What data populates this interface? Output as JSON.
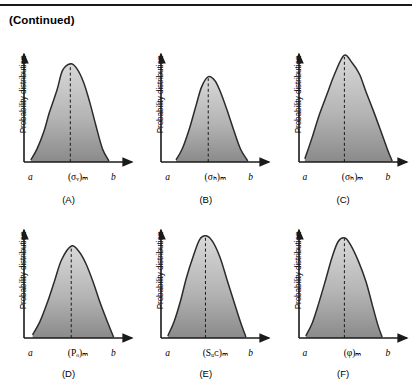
{
  "header": {
    "continued_label": "(Continued)"
  },
  "common": {
    "y_axis_label": "Probability distribution",
    "x_start_label": "a",
    "x_end_label": "b",
    "fill_top_color": "#d9d9d9",
    "fill_bottom_color": "#8a8a8a",
    "curve_color": "#2b2b2b",
    "axis_color": "#1a1a1a",
    "mode_line_color": "#1a1a1a"
  },
  "chart_data": [
    {
      "type": "area",
      "panel": "A",
      "panel_label": "(A)",
      "xlabel": "(σᵥ)ₘ",
      "variable_base": "σ",
      "variable_sub": "v",
      "variable_outer_sub": "m",
      "ylabel": "Probability distribution",
      "x_ticks": [
        "a",
        "b"
      ],
      "xlim": [
        0,
        1
      ],
      "ylim": [
        0,
        1
      ],
      "mode_x": 0.46,
      "support": [
        0.03,
        0.88
      ],
      "peak_height": 0.93,
      "skew": 0.12,
      "grid": false,
      "x": [
        0.03,
        0.1,
        0.17,
        0.24,
        0.31,
        0.38,
        0.46,
        0.53,
        0.6,
        0.67,
        0.74,
        0.81,
        0.88
      ],
      "values": [
        0.02,
        0.12,
        0.28,
        0.47,
        0.68,
        0.86,
        0.93,
        0.88,
        0.75,
        0.56,
        0.34,
        0.13,
        0.01
      ]
    },
    {
      "type": "area",
      "panel": "B",
      "panel_label": "(B)",
      "xlabel": "(σₕ)ₘ",
      "variable_base": "σ",
      "variable_sub": "H",
      "variable_outer_sub": "m",
      "ylabel": "Probability distribution",
      "x_ticks": [
        "a",
        "b"
      ],
      "xlim": [
        0,
        1
      ],
      "ylim": [
        0,
        1
      ],
      "mode_x": 0.47,
      "support": [
        0.12,
        0.9
      ],
      "peak_height": 0.8,
      "skew": 0.1,
      "grid": false,
      "x": [
        0.12,
        0.19,
        0.26,
        0.33,
        0.4,
        0.47,
        0.54,
        0.61,
        0.68,
        0.75,
        0.82,
        0.9
      ],
      "values": [
        0.02,
        0.13,
        0.31,
        0.52,
        0.71,
        0.8,
        0.77,
        0.66,
        0.49,
        0.3,
        0.12,
        0.01
      ]
    },
    {
      "type": "area",
      "panel": "C",
      "panel_label": "(C)",
      "xlabel": "(σₕ)ₘ",
      "variable_base": "σ",
      "variable_sub": "h",
      "variable_outer_sub": "m",
      "ylabel": "Probability distribution",
      "x_ticks": [
        "a",
        "b"
      ],
      "xlim": [
        0,
        1
      ],
      "ylim": [
        0,
        1
      ],
      "mode_x": 0.45,
      "support": [
        0.02,
        0.97
      ],
      "peak_height": 1.0,
      "skew": 0.08,
      "grid": false,
      "x": [
        0.02,
        0.1,
        0.18,
        0.26,
        0.34,
        0.45,
        0.53,
        0.61,
        0.69,
        0.77,
        0.85,
        0.92,
        0.97
      ],
      "values": [
        0.03,
        0.22,
        0.44,
        0.64,
        0.83,
        1.0,
        0.94,
        0.82,
        0.66,
        0.47,
        0.28,
        0.11,
        0.01
      ]
    },
    {
      "type": "area",
      "panel": "D",
      "panel_label": "(D)",
      "xlabel": "(Pₒ)ₘ",
      "variable_base": "P",
      "variable_sub": "o",
      "variable_outer_sub": "m",
      "ylabel": "Probability distribution",
      "x_ticks": [
        "a",
        "b"
      ],
      "xlim": [
        0,
        1
      ],
      "ylim": [
        0,
        1
      ],
      "mode_x": 0.47,
      "support": [
        0.05,
        0.93
      ],
      "peak_height": 0.86,
      "skew": 0.1,
      "grid": false,
      "x": [
        0.05,
        0.13,
        0.21,
        0.29,
        0.37,
        0.47,
        0.55,
        0.63,
        0.71,
        0.79,
        0.87,
        0.93
      ],
      "values": [
        0.03,
        0.15,
        0.33,
        0.54,
        0.74,
        0.86,
        0.82,
        0.7,
        0.53,
        0.33,
        0.13,
        0.01
      ]
    },
    {
      "type": "area",
      "panel": "E",
      "panel_label": "(E)",
      "xlabel": "(Sᵤᴄ)ₘ",
      "variable_base": "S",
      "variable_sub": "UC",
      "variable_outer_sub": "m",
      "ylabel": "Probability distribution",
      "x_ticks": [
        "a",
        "b"
      ],
      "xlim": [
        0,
        1
      ],
      "ylim": [
        0,
        1
      ],
      "mode_x": 0.44,
      "support": [
        0.03,
        0.88
      ],
      "peak_height": 0.97,
      "skew": 0.14,
      "grid": false,
      "x": [
        0.03,
        0.1,
        0.17,
        0.24,
        0.31,
        0.38,
        0.44,
        0.52,
        0.6,
        0.68,
        0.76,
        0.83,
        0.88
      ],
      "values": [
        0.02,
        0.16,
        0.36,
        0.58,
        0.78,
        0.92,
        0.97,
        0.9,
        0.76,
        0.56,
        0.33,
        0.12,
        0.01
      ]
    },
    {
      "type": "area",
      "panel": "F",
      "panel_label": "(F)",
      "xlabel": "(φ)ₘ",
      "variable_base": "φ",
      "variable_sub": "",
      "variable_outer_sub": "m",
      "ylabel": "Probability distribution",
      "x_ticks": [
        "a",
        "b"
      ],
      "xlim": [
        0,
        1
      ],
      "ylim": [
        0,
        1
      ],
      "mode_x": 0.45,
      "support": [
        0.03,
        0.86
      ],
      "peak_height": 0.95,
      "skew": 0.13,
      "grid": false,
      "x": [
        0.03,
        0.1,
        0.17,
        0.24,
        0.31,
        0.38,
        0.45,
        0.52,
        0.6,
        0.68,
        0.75,
        0.82,
        0.86
      ],
      "values": [
        0.02,
        0.15,
        0.34,
        0.55,
        0.76,
        0.9,
        0.95,
        0.88,
        0.73,
        0.53,
        0.31,
        0.11,
        0.01
      ]
    }
  ]
}
